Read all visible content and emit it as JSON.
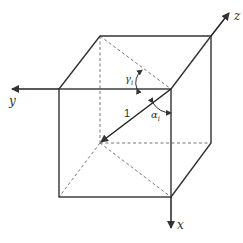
{
  "diagram": {
    "axes": {
      "x": {
        "label": "x"
      },
      "y": {
        "label": "y"
      },
      "z": {
        "label": "z"
      }
    },
    "vector_label": "1",
    "angles": {
      "gamma": {
        "symbol": "γ",
        "sub": "i"
      },
      "alpha": {
        "symbol": "α",
        "sub": "i"
      }
    },
    "colors": {
      "line": "#333333",
      "dashed": "#666666",
      "background": "#ffffff"
    }
  }
}
